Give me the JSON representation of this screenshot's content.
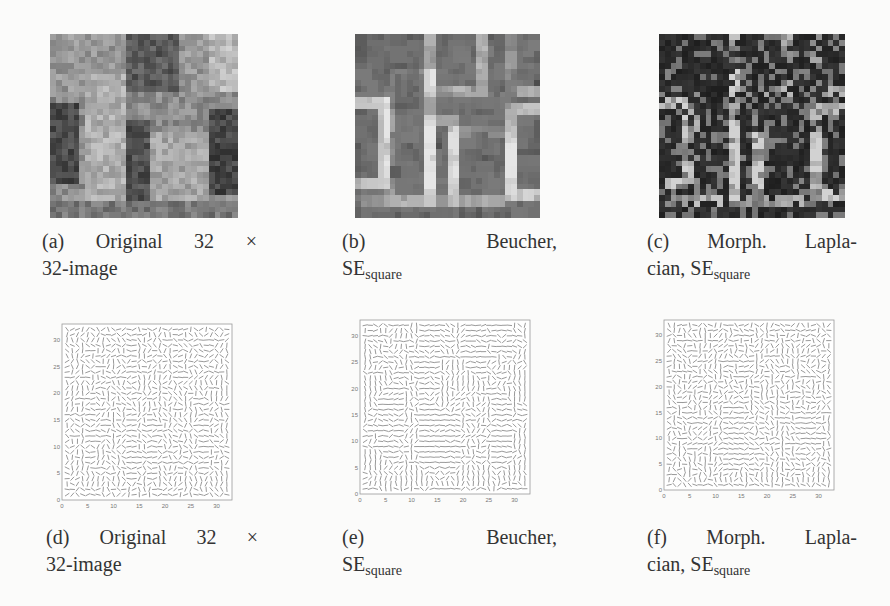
{
  "figure": {
    "panels": [
      {
        "id": "a",
        "type": "image",
        "description": "Original 32x32 grayscale image",
        "grid_size": 32,
        "colormap": "gray",
        "caption": {
          "label": "(a)",
          "line1_words": [
            "Original",
            "32",
            "×"
          ],
          "line2": "32-image"
        }
      },
      {
        "id": "b",
        "type": "image",
        "description": "Beucher morphological gradient with square structuring element",
        "grid_size": 32,
        "colormap": "gray",
        "caption": {
          "label": "(b)",
          "line1_words": [
            "Beucher,"
          ],
          "line2_main": "SE",
          "line2_sub": "square"
        }
      },
      {
        "id": "c",
        "type": "image",
        "description": "Morphological Laplacian with square structuring element",
        "grid_size": 32,
        "colormap": "gray",
        "caption": {
          "label": "(c)",
          "line1_words": [
            "Morph.",
            "Lapla-"
          ],
          "line2_main": "cian, SE",
          "line2_sub": "square"
        }
      },
      {
        "id": "d",
        "type": "quiver",
        "description": "Gradient vector field of original image",
        "caption": {
          "label": "(d)",
          "line1_words": [
            "Original",
            "32",
            "×"
          ],
          "line2": "32-image"
        }
      },
      {
        "id": "e",
        "type": "quiver",
        "description": "Vector field of Beucher gradient",
        "caption": {
          "label": "(e)",
          "line1_words": [
            "Beucher,"
          ],
          "line2_main": "SE",
          "line2_sub": "square"
        }
      },
      {
        "id": "f",
        "type": "quiver",
        "description": "Vector field of morphological Laplacian",
        "caption": {
          "label": "(f)",
          "line1_words": [
            "Morph.",
            "Lapla-"
          ],
          "line2_main": "cian, SE",
          "line2_sub": "square"
        }
      }
    ]
  },
  "chart_data": [
    {
      "type": "quiver",
      "panel": "d",
      "title": "",
      "xlabel": "",
      "ylabel": "",
      "xlim": [
        0,
        33
      ],
      "ylim": [
        0,
        33
      ],
      "x_ticks": [
        "0",
        "5",
        "10",
        "15",
        "20",
        "25",
        "30"
      ],
      "y_ticks": [
        "0",
        "5",
        "10",
        "15",
        "20",
        "25",
        "30"
      ],
      "grid": false,
      "field_size": 32
    },
    {
      "type": "quiver",
      "panel": "e",
      "title": "",
      "xlabel": "",
      "ylabel": "",
      "xlim": [
        0,
        33
      ],
      "ylim": [
        0,
        33
      ],
      "x_ticks": [
        "0",
        "5",
        "10",
        "15",
        "20",
        "25",
        "30"
      ],
      "y_ticks": [
        "0",
        "5",
        "10",
        "15",
        "20",
        "25",
        "30"
      ],
      "grid": false,
      "field_size": 32
    },
    {
      "type": "quiver",
      "panel": "f",
      "title": "",
      "xlabel": "",
      "ylabel": "",
      "xlim": [
        0,
        33
      ],
      "ylim": [
        0,
        33
      ],
      "x_ticks": [
        "0",
        "5",
        "10",
        "15",
        "20",
        "25",
        "30"
      ],
      "y_ticks": [
        "0",
        "5",
        "10",
        "15",
        "20",
        "25",
        "30"
      ],
      "grid": false,
      "field_size": 32
    }
  ]
}
